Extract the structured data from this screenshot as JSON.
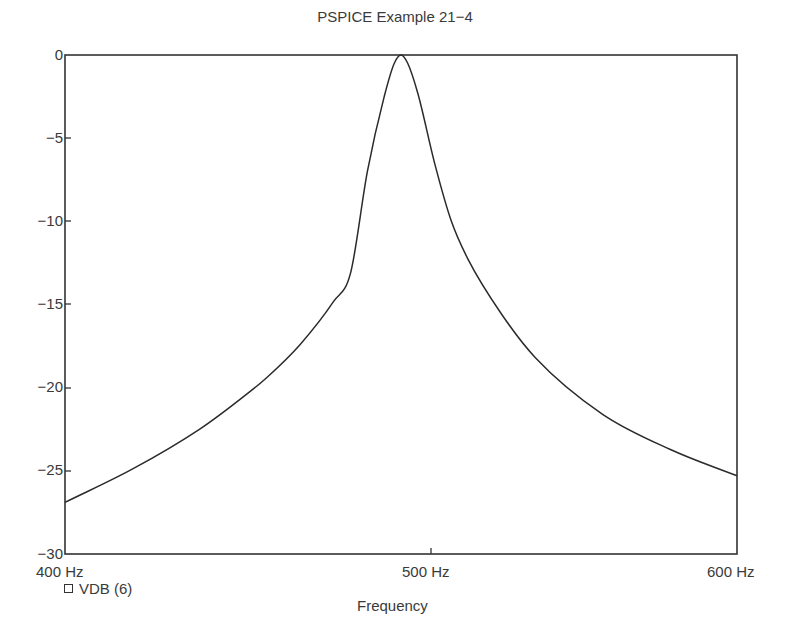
{
  "chart_data": {
    "type": "line",
    "title": "PSPICE Example 21−4",
    "xlabel": "Frequency",
    "ylabel": "",
    "xlim": [
      400,
      600
    ],
    "ylim": [
      -30,
      0
    ],
    "x_ticks": [
      "400 Hz",
      "500 Hz",
      "600 Hz"
    ],
    "y_ticks": [
      "0",
      "−5",
      "−10",
      "−15",
      "−20",
      "−25",
      "−30"
    ],
    "grid": false,
    "legend_position": "bottom-left",
    "series": [
      {
        "name": "VDB (6)",
        "x": [
          400,
          420,
          440,
          454,
          460,
          470,
          480,
          485,
          490,
          495,
          498,
          500,
          502,
          505,
          510,
          515,
          520,
          530,
          540,
          560,
          580,
          600
        ],
        "values": [
          -26.9,
          -24.9,
          -22.5,
          -20.4,
          -19.4,
          -17.4,
          -14.8,
          -13.1,
          -7.0,
          -2.5,
          -0.5,
          0.0,
          -0.5,
          -2.3,
          -6.5,
          -10.0,
          -12.3,
          -15.6,
          -18.2,
          -21.6,
          -23.7,
          -25.3
        ]
      }
    ]
  },
  "title": "PSPICE Example 21−4",
  "axes": {
    "x_label": "Frequency",
    "x_ticks": [
      "400 Hz",
      "500 Hz",
      "600 Hz"
    ],
    "y_ticks": [
      "0",
      "−5",
      "−10",
      "−15",
      "−20",
      "−25",
      "−30"
    ]
  },
  "legend": {
    "label": "VDB (6)"
  },
  "colors": {
    "line": "#2b2b2b",
    "axis": "#333333",
    "text": "#3a3a3a"
  }
}
